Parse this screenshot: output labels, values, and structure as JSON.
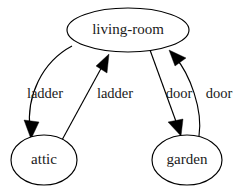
{
  "diagram": {
    "type": "directed-graph",
    "background_color": "#ffffff",
    "stroke_color": "#000000",
    "text_color": "#1a1a1a",
    "nodes": [
      {
        "id": "living-room",
        "label": "living-room",
        "shape": "ellipse",
        "cx": 128,
        "cy": 30,
        "rx": 61,
        "ry": 22
      },
      {
        "id": "attic",
        "label": "attic",
        "shape": "ellipse",
        "cx": 44,
        "cy": 160,
        "rx": 33,
        "ry": 25
      },
      {
        "id": "garden",
        "label": "garden",
        "shape": "ellipse",
        "cx": 187,
        "cy": 160,
        "rx": 35,
        "ry": 25
      }
    ],
    "edges": [
      {
        "id": "livingroom-to-attic",
        "from": "living-room",
        "to": "attic",
        "label": "ladder",
        "label_x": 45,
        "label_y": 95,
        "style": "curved-left",
        "path": "M 72,46 C 42,62 26,96 30,130",
        "arrow": "31,139 24,120 39,122"
      },
      {
        "id": "attic-to-livingroom",
        "from": "attic",
        "to": "living-room",
        "label": "ladder",
        "label_x": 115,
        "label_y": 95,
        "style": "straight",
        "path": "M 62,140 L 104,63",
        "arrow": "109,54 107,73 96,66"
      },
      {
        "id": "livingroom-to-garden",
        "from": "living-room",
        "to": "garden",
        "label": "door",
        "label_x": 179,
        "label_y": 95,
        "style": "straight",
        "path": "M 150,50 L 178,127",
        "arrow": "181,136 168,122 183,119"
      },
      {
        "id": "garden-to-livingroom",
        "from": "garden",
        "to": "living-room",
        "label": "door",
        "label_x": 219,
        "label_y": 95,
        "style": "curved-right",
        "path": "M 199,136 C 203,110 190,74 175,57",
        "arrow": "169,50 186,58 175,66"
      }
    ]
  }
}
